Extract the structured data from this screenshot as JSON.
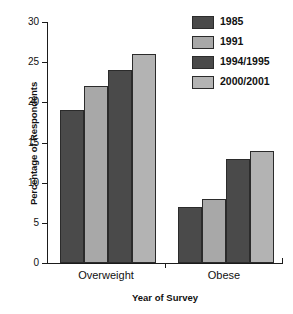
{
  "chart_data": {
    "type": "bar",
    "title": "",
    "xlabel": "Year of Survey",
    "ylabel": "Percentage of Respondents",
    "categories": [
      "Overweight",
      "Obese"
    ],
    "series": [
      {
        "name": "1985",
        "values": [
          19,
          7
        ],
        "color": "#4a4a4a"
      },
      {
        "name": "1991",
        "values": [
          22,
          8
        ],
        "color": "#a8a8a8"
      },
      {
        "name": "1994/1995",
        "values": [
          24,
          13
        ],
        "color": "#4a4a4a"
      },
      {
        "name": "2000/2001",
        "values": [
          26,
          14
        ],
        "color": "#b3b3b3"
      }
    ],
    "ylim": [
      0,
      30
    ],
    "yticks": [
      0,
      5,
      10,
      15,
      20,
      25,
      30
    ],
    "ytick_labels": [
      "0",
      "5",
      "10",
      "15",
      "20",
      "25",
      "30"
    ],
    "grid": false,
    "legend_position": "top-right"
  },
  "legend": {
    "items": [
      {
        "label": "1985"
      },
      {
        "label": "1991"
      },
      {
        "label": "1994/1995"
      },
      {
        "label": "2000/2001"
      }
    ]
  }
}
